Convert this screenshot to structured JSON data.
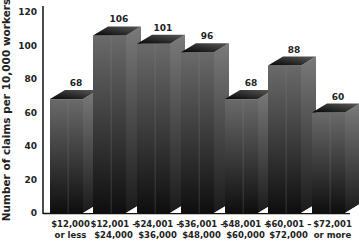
{
  "chart_data": {
    "type": "bar",
    "title": "",
    "xlabel": "",
    "ylabel": "Number of claims per 10,000 workers",
    "ylim": [
      0,
      120
    ],
    "yticks": [
      0,
      20,
      40,
      60,
      80,
      100,
      120
    ],
    "grid": false,
    "legend": null,
    "style": "3d",
    "categories": [
      [
        "$12,000",
        "or less"
      ],
      [
        "$12,001 –",
        "$24,000"
      ],
      [
        "$24,001 –",
        "$36,000"
      ],
      [
        "$36,001 –",
        "$48,000"
      ],
      [
        "$48,001 –",
        "$60,000"
      ],
      [
        "$60,001 –",
        "$72,000"
      ],
      [
        "$72,001",
        "or more"
      ]
    ],
    "values": [
      68,
      106,
      101,
      96,
      68,
      88,
      60
    ]
  }
}
